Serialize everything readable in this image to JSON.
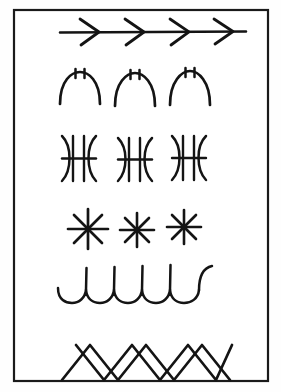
{
  "plate": {
    "title": "Ornamental stitch pattern plate",
    "background_color": "#fefefe",
    "ink_color": "#141414",
    "frame": {
      "name": "border-frame",
      "x": 14,
      "y": 10,
      "width": 254,
      "height": 371,
      "stroke_color": "#1a1a1a",
      "stroke_width": 2.2
    },
    "row_count": 6
  },
  "rows": [
    {
      "index": 1,
      "name": "arrow-chevron-band",
      "label": "Arrowed running stitch",
      "description": "Horizontal line overlaid with four right-pointing chevrons",
      "motif": "chevron-arrow",
      "motif_count": 4,
      "baseline_y": 32,
      "x_start": 60,
      "x_end": 246,
      "stroke_width": 2.6
    },
    {
      "index": 2,
      "name": "arch-tick-band",
      "label": "Crested arch stitch",
      "description": "Three inverted-U arches each topped with two short vertical ticks",
      "motif": "arch-with-ticks",
      "motif_count": 3,
      "baseline_y": 104,
      "x_start": 60,
      "x_end": 210,
      "stroke_width": 2.6
    },
    {
      "index": 3,
      "name": "double-arc-ladder-band",
      "label": "Ladder stitch between opposed arcs",
      "description": "Three glyphs of two opposed arcs enclosing two vertical bars crossed by a horizontal bar",
      "motif": "opposed-arcs-ladder",
      "motif_count": 3,
      "baseline_y": 158,
      "x_start": 60,
      "x_end": 212,
      "stroke_width": 2.4
    },
    {
      "index": 4,
      "name": "star-asterisk-band",
      "label": "Eight-point star stitch",
      "description": "Three eight-spoke asterisk stars",
      "motif": "eight-point-star",
      "motif_count": 3,
      "spokes_per_star": 8,
      "baseline_y": 229,
      "x_start": 68,
      "x_end": 200,
      "stroke_width": 2.6
    },
    {
      "index": 5,
      "name": "scallop-hook-band",
      "label": "Hooked scallop stitch",
      "description": "Scalloped wave line with tall upward hooks rising at each junction",
      "motif": "scallop-with-hook",
      "motif_count": 5,
      "baseline_y": 297,
      "x_start": 58,
      "x_end": 215,
      "stroke_width": 2.4
    },
    {
      "index": 6,
      "name": "cross-stitch-zigzag-band",
      "label": "Crossed zigzag stitch",
      "description": "Two interlacing zigzag lines forming a row of crosses resting on the lower frame line",
      "motif": "crossed-zigzag",
      "motif_count": 6,
      "baseline_y": 380,
      "x_start": 62,
      "x_end": 232,
      "stroke_width": 2.6
    }
  ]
}
